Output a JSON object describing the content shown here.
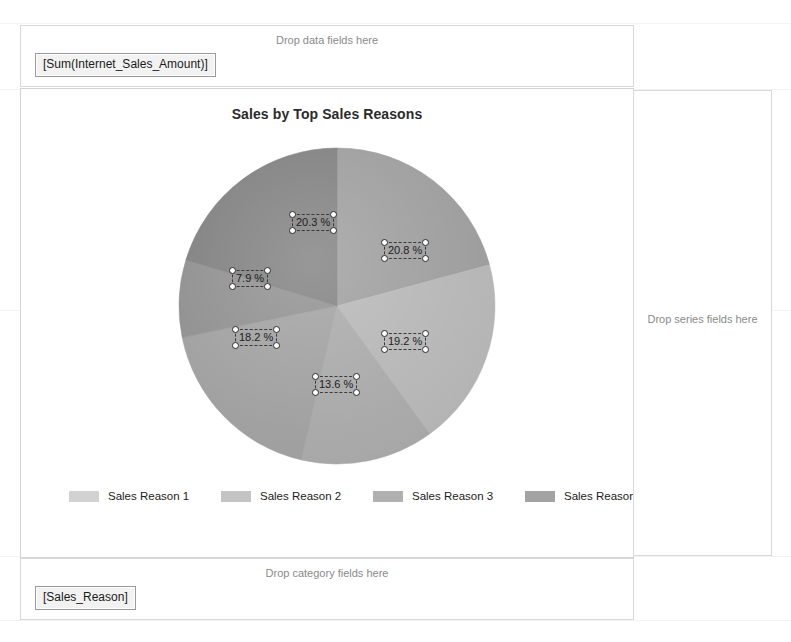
{
  "dropzones": {
    "data": {
      "hint": "Drop data fields here",
      "chip": "[Sum(Internet_Sales_Amount)]"
    },
    "category": {
      "hint": "Drop category fields here",
      "chip": "[Sales_Reason]"
    },
    "series": {
      "hint": "Drop series fields here"
    }
  },
  "chart_data": {
    "type": "pie",
    "title": "Sales by Top Sales Reasons",
    "xlabel": "",
    "ylabel": "",
    "legend_position": "bottom",
    "grid": false,
    "categories": [
      "Sales Reason 1",
      "Sales Reason 2",
      "Sales Reason 3",
      "Sales Reason 4",
      "Sales Reason 5",
      "Sales Reason 6"
    ],
    "values": [
      20.8,
      19.2,
      13.6,
      18.2,
      7.9,
      20.3
    ],
    "labels": [
      "20.8 %",
      "19.2 %",
      "13.6 %",
      "18.2 %",
      "7.9 %",
      "20.3 %"
    ],
    "colors": [
      "#9c9c9c",
      "#b5b5b5",
      "#a8a8a8",
      "#9f9f9f",
      "#8e8e8e",
      "#7e7e7e"
    ],
    "legend_colors": [
      "#d2d2d2",
      "#c4c4c4",
      "#b0b0b0",
      "#a3a3a3",
      "#8d8d8d",
      "#6f6f6f"
    ],
    "selected_labels": [
      "20.3 %",
      "20.8 %",
      "7.9 %",
      "18.2 %",
      "19.2 %",
      "13.6 %"
    ]
  }
}
